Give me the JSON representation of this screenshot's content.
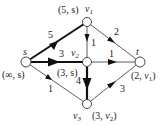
{
  "graph": {
    "nodes": [
      {
        "id": "s",
        "name": "s",
        "x": 26,
        "y": 62,
        "mark": "(∞, s)"
      },
      {
        "id": "v1",
        "name": "v1",
        "x": 87,
        "y": 22,
        "mark": "(5, s)"
      },
      {
        "id": "v2",
        "name": "v2",
        "x": 87,
        "y": 62,
        "mark": "(3, s)"
      },
      {
        "id": "t",
        "name": "t",
        "x": 140,
        "y": 62,
        "mark": "(2, v1)"
      },
      {
        "id": "v3",
        "name": "v3",
        "x": 87,
        "y": 104,
        "mark": "(3, v2)"
      }
    ],
    "edges": [
      {
        "from": "s",
        "to": "v1",
        "weight": "5",
        "bold": true
      },
      {
        "from": "s",
        "to": "v2",
        "weight": "3",
        "bold": true
      },
      {
        "from": "s",
        "to": "v3",
        "weight": "1",
        "bold": false
      },
      {
        "from": "v1",
        "to": "v2",
        "weight": "1",
        "bold": false
      },
      {
        "from": "v1",
        "to": "t",
        "weight": "2",
        "bold": false
      },
      {
        "from": "v2",
        "to": "t",
        "weight": "1",
        "bold": false
      },
      {
        "from": "v2",
        "to": "v3",
        "weight": "4",
        "bold": true
      },
      {
        "from": "v3",
        "to": "t",
        "weight": "3",
        "bold": false
      }
    ]
  },
  "labels": {
    "s_name": "s",
    "s_mark": "(∞, s)",
    "v1_mark": "(5, s)",
    "v1_name_v": "v",
    "v1_name_sub": "1",
    "v2_name_v": "v",
    "v2_name_sub": "2",
    "v2_mark": "(3, s)",
    "t_name": "t",
    "t_mark_pre": "(2, ",
    "t_mark_v": "v",
    "t_mark_sub": "1",
    "t_mark_post": ")",
    "v3_name_v": "v",
    "v3_name_sub": "3",
    "v3_mark_pre": "(3, ",
    "v3_mark_v": "v",
    "v3_mark_sub": "2",
    "v3_mark_post": ")",
    "w_s_v1": "5",
    "w_s_v2": "3",
    "w_s_v3": "1",
    "w_v1_v2": "1",
    "w_v1_t": "2",
    "w_v2_t": "1",
    "w_v2_v3": "4",
    "w_v3_t": "3"
  }
}
